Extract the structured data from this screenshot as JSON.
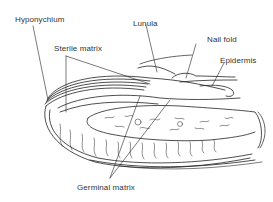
{
  "diagram": {
    "labels": {
      "hyponychium": "Hyponychium",
      "lunula": "Lunula",
      "sterile_matrix": "Sterile matrix",
      "nail_fold": "Nail fold",
      "epidermis": "Epidermis",
      "germinal_matrix": "Germinal matrix"
    },
    "colors": {
      "line": "#222222",
      "text": "#333333",
      "background": "#ffffff"
    }
  }
}
